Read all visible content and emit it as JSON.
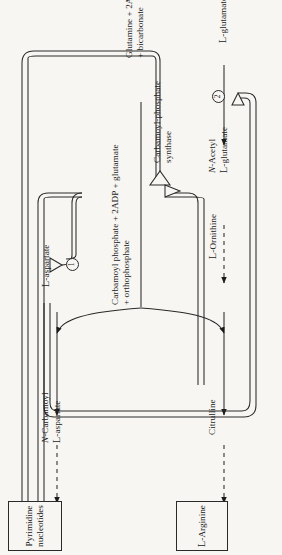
{
  "figure": {
    "type": "pathway-diagram",
    "orientation": "rotated-90-ccw",
    "background_color": "#f7f6f2",
    "ink_color": "#1b1b1b"
  },
  "boxes": [
    {
      "id": "pyrimidine",
      "line1": "Pyrimidine",
      "line2": "nucleotides"
    },
    {
      "id": "arginine",
      "text": "L-Arginine",
      "prefix": "L",
      "stem": "-Arginine"
    }
  ],
  "products": {
    "carbamoyl_aspartate": {
      "line1": "N-Carbamoyl",
      "line1_italic": "N",
      "line2": "L-aspartate",
      "line2_prefix": "L",
      "line2_stem": "-aspartate"
    },
    "carbamoyl_phosphate": {
      "line1": "Carbamoyl phosphate + 2ADP + glutamate",
      "line2": "+ orthophosphate"
    },
    "citrulline": {
      "text": "Citrulline"
    }
  },
  "substrates": {
    "aspartate": {
      "text": "L-aspartate",
      "prefix": "L",
      "stem": "-aspartate"
    },
    "ornithine": {
      "text": "L-Ornithine",
      "prefix": "L",
      "stem": "-Ornithine"
    },
    "glutamine": {
      "line1": "Glutamine + 2ATP",
      "line2": "+ bicarbonate"
    },
    "glutamate": {
      "text": "L-glutamate",
      "prefix": "L",
      "stem": "-glutamate"
    },
    "acetyl_glutamate": {
      "line1": "N-Acetyl",
      "line1_italic": "N",
      "line2": "L-glutamate",
      "line2_prefix": "L",
      "line2_stem": "-glutamate"
    }
  },
  "enzyme": {
    "line1": "Carbamoyl-phosphate",
    "line2": "synthase"
  },
  "steps": [
    {
      "id": "step-1",
      "marker": "1"
    },
    {
      "id": "step-2",
      "marker": "2"
    }
  ],
  "margin_note": {
    "text": ""
  }
}
